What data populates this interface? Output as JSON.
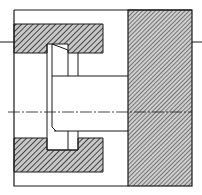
{
  "drawing": {
    "type": "mechanical-section-drawing",
    "colors": {
      "line": "#1a1a1a",
      "hatch": "#2a2a2a",
      "background": "#ffffff",
      "hatch_fill": "#bdbdbd"
    },
    "parts": [
      {
        "name": "housing-upper-section",
        "hatched": true
      },
      {
        "name": "housing-lower-section",
        "hatched": true
      },
      {
        "name": "right-block",
        "hatched": true
      },
      {
        "name": "shaft",
        "hatched": false
      },
      {
        "name": "tapered-pin",
        "hatched": false
      },
      {
        "name": "centerline",
        "style": "dash-dot"
      }
    ]
  }
}
